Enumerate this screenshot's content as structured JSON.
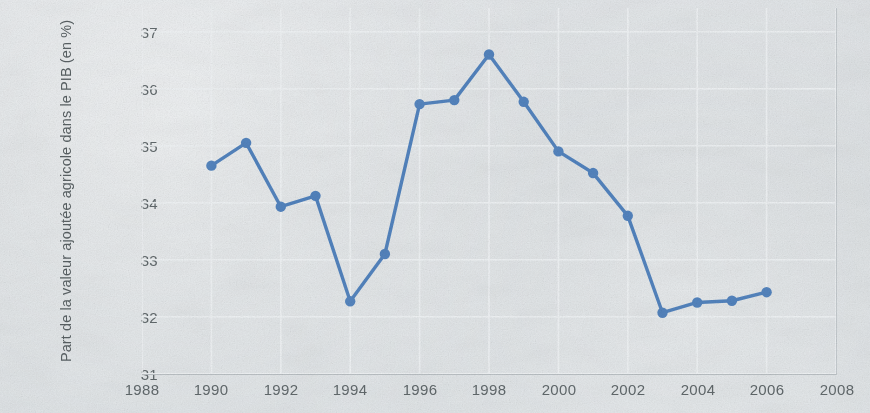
{
  "chart_data": {
    "type": "line",
    "title": "",
    "subtitle": "",
    "xlabel": "",
    "ylabel": "Part de la valeur ajoutée agricole dans le PIB (en %)",
    "xlim": [
      1988,
      2008
    ],
    "ylim": [
      31,
      37
    ],
    "xticks": [
      "1988",
      "1990",
      "1992",
      "1994",
      "1996",
      "1998",
      "2000",
      "2002",
      "2004",
      "2006",
      "2008"
    ],
    "yticks": [
      "31",
      "32",
      "33",
      "34",
      "35",
      "36",
      "37"
    ],
    "grid": true,
    "legend": null,
    "series": [
      {
        "name": "Part de la valeur ajoutée agricole dans le PIB (en %)",
        "color": "#4f81bd",
        "marker": "circle",
        "x": [
          1990,
          1991,
          1992,
          1993,
          1994,
          1995,
          1996,
          1997,
          1998,
          1999,
          2000,
          2001,
          2002,
          2003,
          2004,
          2005,
          2006
        ],
        "values": [
          34.65,
          35.05,
          33.93,
          34.12,
          32.27,
          33.1,
          35.73,
          35.8,
          36.6,
          35.77,
          34.9,
          34.52,
          33.77,
          32.07,
          32.25,
          32.28,
          32.43
        ]
      }
    ]
  },
  "colors": {
    "line": "#4f81bd",
    "marker": "#4f81bd",
    "grid": "#f0f3f5",
    "axis": "#b9bfc3",
    "text": "#5d6568",
    "background": "#d9dee1"
  },
  "ylabel_lines": {
    "line1": "Part de la valeur ajoutée agricole dans le",
    "line2": "PIB (en %)"
  }
}
